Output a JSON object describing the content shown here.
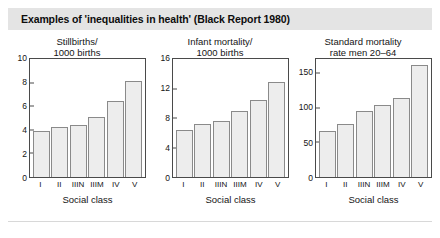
{
  "header": {
    "title": "Examples of 'inequalities in health' (Black Report 1980)"
  },
  "chart_data": [
    {
      "type": "bar",
      "title": "Stillbirths/\n1000 births",
      "title_line1": "Stillbirths/",
      "title_line2": "1000 births",
      "categories": [
        "I",
        "II",
        "IIIN",
        "IIIM",
        "IV",
        "V"
      ],
      "values": [
        3.9,
        4.2,
        4.45,
        5.1,
        6.45,
        8.1
      ],
      "xlabel": "Social class",
      "ylabel": "",
      "ylim": [
        0,
        10
      ],
      "yticks": [
        0,
        2,
        4,
        6,
        8,
        10
      ],
      "grid": false,
      "legend": "none"
    },
    {
      "type": "bar",
      "title": "Infant mortality/\n1000 births",
      "title_line1": "Infant mortality/",
      "title_line2": "1000 births",
      "categories": [
        "I",
        "II",
        "IIIN",
        "IIIM",
        "IV",
        "V"
      ],
      "values": [
        6.4,
        7.2,
        7.6,
        9.0,
        10.4,
        12.9
      ],
      "xlabel": "Social class",
      "ylabel": "",
      "ylim": [
        0,
        16
      ],
      "yticks": [
        0,
        4,
        8,
        12,
        16
      ],
      "grid": false,
      "legend": "none"
    },
    {
      "type": "bar",
      "title": "Standard mortality\nrate men 20–64",
      "title_line1": "Standard mortality",
      "title_line2": "rate men 20–64",
      "categories": [
        "I",
        "II",
        "IIIN",
        "IIIM",
        "IV",
        "V"
      ],
      "values": [
        67,
        76,
        95,
        104,
        114,
        162
      ],
      "xlabel": "Social class",
      "ylabel": "",
      "ylim": [
        0,
        170
      ],
      "yticks": [
        0,
        50,
        100,
        150
      ],
      "grid": false,
      "legend": "none"
    }
  ],
  "colors": {
    "title_bar": "#e4e4e4",
    "bar_fill": "#ededed",
    "bar_border": "#8a8a8a",
    "axis": "#4a4a4a",
    "text": "#141414"
  }
}
